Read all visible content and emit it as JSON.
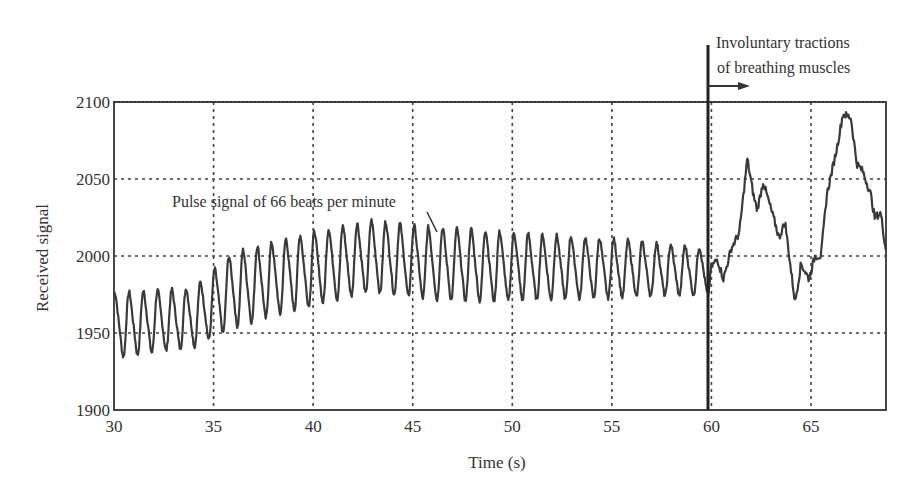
{
  "chart_data": {
    "type": "line",
    "title": "",
    "xlabel": "Time (s)",
    "ylabel": "Received signal",
    "xlim": [
      30,
      69
    ],
    "ylim": [
      1900,
      2100
    ],
    "xticks": [
      30,
      35,
      40,
      45,
      50,
      55,
      60,
      65
    ],
    "yticks": [
      1900,
      1950,
      2000,
      2050,
      2100
    ],
    "grid": true,
    "annotations": [
      {
        "text": "Pulse signal of 66 beats per minute",
        "x": 46.2,
        "y": 2015
      },
      {
        "text_line1": "Involuntary tractions",
        "text_line2": "of breathing muscles",
        "x": 60,
        "arrow": "right"
      }
    ],
    "series": [
      {
        "name": "Received signal",
        "pulse_rate_bpm": 66,
        "segment_pulse": {
          "t_start": 30,
          "t_end": 60,
          "baseline": [
            [
              30,
              1955
            ],
            [
              34,
              1960
            ],
            [
              36,
              1978
            ],
            [
              40,
              1992
            ],
            [
              43,
              2000
            ],
            [
              46,
              1995
            ],
            [
              50,
              1993
            ],
            [
              55,
              1992
            ],
            [
              60,
              1990
            ]
          ],
          "amplitude": [
            [
              30,
              20
            ],
            [
              34,
              18
            ],
            [
              36,
              23
            ],
            [
              42,
              22
            ],
            [
              48,
              22
            ],
            [
              55,
              18
            ],
            [
              60,
              14
            ]
          ]
        },
        "segment_breathing": {
          "points": [
            [
              60,
              1993
            ],
            [
              60.3,
              1998
            ],
            [
              60.6,
              1985
            ],
            [
              61,
              2005
            ],
            [
              61.4,
              2015
            ],
            [
              61.8,
              2063
            ],
            [
              62.1,
              2040
            ],
            [
              62.3,
              2030
            ],
            [
              62.6,
              2048
            ],
            [
              63,
              2030
            ],
            [
              63.4,
              2012
            ],
            [
              63.7,
              2022
            ],
            [
              64,
              1990
            ],
            [
              64.2,
              1970
            ],
            [
              64.5,
              1995
            ],
            [
              64.9,
              1985
            ],
            [
              65.2,
              2000
            ],
            [
              65.5,
              2000
            ],
            [
              65.8,
              2040
            ],
            [
              66.3,
              2070
            ],
            [
              66.6,
              2092
            ],
            [
              67,
              2090
            ],
            [
              67.3,
              2060
            ],
            [
              67.6,
              2055
            ],
            [
              68,
              2040
            ],
            [
              68.2,
              2025
            ],
            [
              68.5,
              2028
            ],
            [
              68.8,
              2000
            ]
          ]
        }
      }
    ]
  }
}
